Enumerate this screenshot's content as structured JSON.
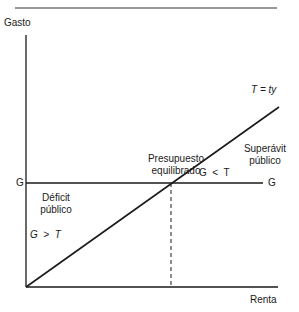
{
  "diagram": {
    "y_axis_label": "Gasto",
    "x_axis_label": "Renta",
    "g_left_label": "G",
    "g_right_label": "G",
    "tax_line_label": "T = ty",
    "balanced_label_line1": "Presupuesto",
    "balanced_label_line2": "equilibrado",
    "deficit_label_line1": "Déficit",
    "deficit_label_line2": "público",
    "deficit_condition": "G  >  T",
    "surplus_label_line1": "Superávit",
    "surplus_label_line2": "público",
    "surplus_condition": "G  <  T",
    "line_color": "#1a1a1a"
  }
}
